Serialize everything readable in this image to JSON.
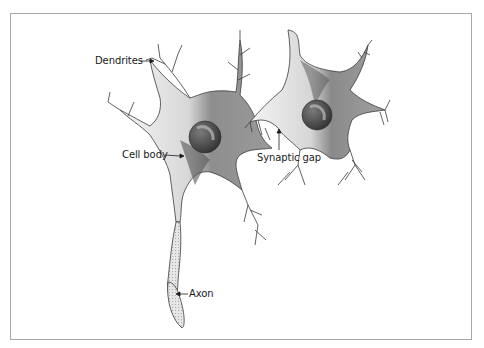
{
  "diagram": {
    "labels": {
      "dendrites": "Dendrites",
      "cell_body": "Cell body",
      "synaptic_gap": "Synaptic gap",
      "axon": "Axon"
    },
    "colors": {
      "border": "#a8a8a8",
      "outline": "#3a3a3a",
      "cytoplasm_dark": "#5a5a5a",
      "cytoplasm_mid": "#8a8a8a",
      "nucleus": "#555555",
      "label_text": "#1a1a1a"
    }
  }
}
